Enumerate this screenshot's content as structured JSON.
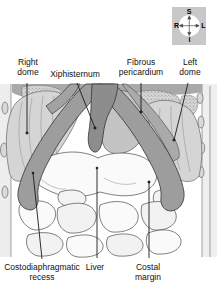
{
  "labels": {
    "right_dome": "Right dome",
    "xiphisternum": "Xiphisternum",
    "fibrous_pericardium": "Fibrous pericardium",
    "left_dome": "Left dome",
    "costodiaphragmatic_recess": "Costodiaphragmatic recess",
    "liver": "Liver",
    "costal_margin": "Costal margin"
  },
  "compass": {
    "superior": "S",
    "inferior": "I",
    "right": "R",
    "left": "L"
  },
  "colors": {
    "background": "#ffffff",
    "label_text": "#111111",
    "compass_square": "#c8c8c8",
    "costal_band": "#9d9d9d",
    "diaphragm_dome": "#d5d5d5",
    "sternum": "#8d8d8d",
    "pericardium": "#c4c4c4",
    "leader_line": "#1a1a1a"
  }
}
